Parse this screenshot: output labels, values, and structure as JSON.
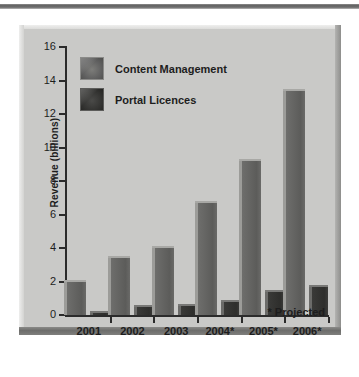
{
  "chart_data": {
    "type": "bar",
    "title": "",
    "xlabel": "",
    "ylabel": "Revenue (billions)",
    "ylim": [
      0,
      16
    ],
    "ytick_values": [
      0,
      2,
      4,
      6,
      8,
      10,
      12,
      14,
      16
    ],
    "ytick_labels": [
      "0",
      "2",
      "4",
      "6",
      "8",
      "10",
      "12",
      "14",
      "16"
    ],
    "categories": [
      "2001",
      "2002",
      "2003",
      "2004*",
      "2005*",
      "2006*"
    ],
    "grid": false,
    "legend_position": "top-left",
    "series": [
      {
        "name": "Content Management",
        "color": "#5c5c5a",
        "values": [
          2.1,
          3.5,
          4.1,
          6.8,
          9.3,
          13.5
        ]
      },
      {
        "name": "Portal Licences",
        "color": "#2e2e2c",
        "values": [
          0.25,
          0.6,
          0.65,
          0.9,
          1.5,
          1.8
        ]
      }
    ],
    "annotations": [
      "* Projected"
    ]
  },
  "figure": {
    "footnote": "* Projected",
    "panel_background": "#c9c9c7",
    "axis_color": "#2b2b2b",
    "text_color": "#1d1d1d"
  }
}
